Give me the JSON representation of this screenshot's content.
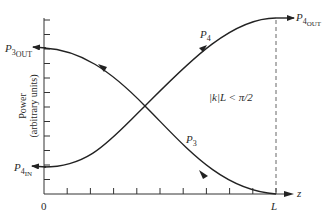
{
  "diagram": {
    "type": "coupled-mode power exchange plot",
    "y_axis": {
      "label_line1": "Power",
      "label_line2": "(arbitrary units)",
      "tick_count": 12
    },
    "x_axis": {
      "variable": "z",
      "origin_label": "0",
      "end_label": "L",
      "tick_count": 10
    },
    "condition": "|k|L < π/2",
    "curves": [
      {
        "name": "P4",
        "label_base": "P",
        "label_sub": "4",
        "start_label_base": "P",
        "start_label_sub": "4",
        "start_label_subsub": "IN",
        "end_label_base": "P",
        "end_label_sub": "4",
        "end_label_subsub": "OUT",
        "trend": "increasing from low at z=0 to maximum at z=L"
      },
      {
        "name": "P3",
        "label_base": "P",
        "label_sub": "3",
        "start_label_base": "P",
        "start_label_sub": "3",
        "start_label_subsub": "OUT",
        "trend": "decreasing from high at z=0 to zero at z=L (power flows toward z=0)"
      }
    ]
  }
}
